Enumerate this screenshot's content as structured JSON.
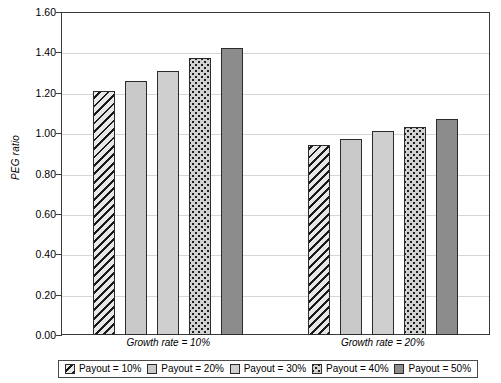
{
  "chart_data": {
    "type": "bar",
    "title": "",
    "xlabel": "",
    "ylabel": "PEG ratio",
    "ylim": [
      0.0,
      1.6
    ],
    "grid": true,
    "legend_position": "bottom",
    "categories": [
      "Growth rate = 10%",
      "Growth rate = 20%"
    ],
    "series": [
      {
        "name": "Payout = 10%",
        "pattern": "diagonal-hatch",
        "values": [
          1.21,
          0.94
        ]
      },
      {
        "name": "Payout = 20%",
        "pattern": "light-gray-solid",
        "values": [
          1.26,
          0.97
        ]
      },
      {
        "name": "Payout = 30%",
        "pattern": "lighter-gray-solid",
        "values": [
          1.31,
          1.01
        ]
      },
      {
        "name": "Payout = 40%",
        "pattern": "dotted",
        "values": [
          1.37,
          1.03
        ]
      },
      {
        "name": "Payout = 50%",
        "pattern": "dark-gray-solid",
        "values": [
          1.42,
          1.07
        ]
      }
    ],
    "ytick_labels": [
      "0.00",
      "0.20",
      "0.40",
      "0.60",
      "0.80",
      "1.00",
      "1.20",
      "1.40",
      "1.60"
    ],
    "ytick_values": [
      0.0,
      0.2,
      0.4,
      0.6,
      0.8,
      1.0,
      1.2,
      1.4,
      1.6
    ],
    "colors": {
      "axis": "#3a3a3a",
      "gridline": "#d6d6d6",
      "bar_outline": "#2b2b2b",
      "background": "#ffffff"
    }
  }
}
